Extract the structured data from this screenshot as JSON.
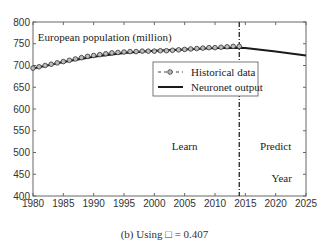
{
  "chart_data": {
    "type": "line",
    "title": "",
    "xlabel": "Year",
    "ylabel": "European population (million)",
    "xlim": [
      1980,
      2025
    ],
    "ylim": [
      400,
      800
    ],
    "xticks": [
      1980,
      1985,
      1990,
      1995,
      2000,
      2005,
      2010,
      2015,
      2020,
      2025
    ],
    "yticks": [
      400,
      450,
      500,
      550,
      600,
      650,
      700,
      750,
      800
    ],
    "grid": false,
    "legend_position": "upper center",
    "series": [
      {
        "name": "Historical data",
        "style": "dashed with circle markers",
        "x": [
          1980,
          1981,
          1982,
          1983,
          1984,
          1985,
          1986,
          1987,
          1988,
          1989,
          1990,
          1991,
          1992,
          1993,
          1994,
          1995,
          1996,
          1997,
          1998,
          1999,
          2000,
          2001,
          2002,
          2003,
          2004,
          2005,
          2006,
          2007,
          2008,
          2009,
          2010,
          2011,
          2012,
          2013,
          2014
        ],
        "values": [
          694,
          697,
          700,
          703,
          706,
          709,
          712,
          715,
          718,
          721,
          723,
          725,
          727,
          729,
          730,
          731,
          732,
          732,
          733,
          733,
          733,
          734,
          734,
          735,
          736,
          737,
          738,
          739,
          740,
          741,
          741,
          742,
          743,
          744,
          744
        ]
      },
      {
        "name": "Neuronet output",
        "style": "solid",
        "x": [
          1980,
          1985,
          1990,
          1995,
          2000,
          2005,
          2010,
          2014,
          2015,
          2020,
          2025
        ],
        "values": [
          693,
          708,
          720,
          729,
          734,
          737,
          740,
          741,
          740,
          732,
          723
        ]
      }
    ],
    "annotations": [
      {
        "text": "European population (million)",
        "x": 1980.3,
        "y": 762
      },
      {
        "text": "Learn",
        "x": 2005,
        "y": 505
      },
      {
        "text": "Predict",
        "x": 2020,
        "y": 505
      },
      {
        "text": "Year",
        "x": 2021,
        "y": 432
      }
    ],
    "vline": {
      "x": 2014,
      "style": "dash-dot"
    }
  },
  "caption": "(b) Using □ = 0.407"
}
